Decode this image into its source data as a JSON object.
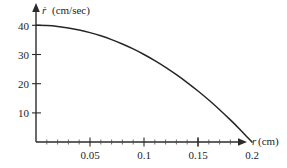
{
  "chart_data": {
    "type": "line",
    "title": "",
    "subtitle": "",
    "xlabel_var": "r",
    "xlabel_units": "(cm)",
    "xlabel": "r (cm)",
    "ylabel_var": "ṙ",
    "ylabel_units": "(cm/sec)",
    "ylabel": "ṙ (cm/sec)",
    "xlim": [
      0,
      0.215
    ],
    "ylim": [
      0,
      43
    ],
    "grid": false,
    "legend": null,
    "x_ticks": [
      0.05,
      0.1,
      0.15,
      0.2
    ],
    "x_tick_labels": [
      "0.05",
      "0.1",
      "0.15",
      "0.2"
    ],
    "x_minor_tick_count_between": 4,
    "y_ticks": [
      10,
      20,
      30,
      40
    ],
    "y_tick_labels": [
      "10",
      "20",
      "30",
      "40"
    ],
    "series": [
      {
        "name": "radial velocity",
        "x": [
          0.0,
          0.01,
          0.02,
          0.03,
          0.04,
          0.05,
          0.06,
          0.07,
          0.08,
          0.09,
          0.1,
          0.11,
          0.12,
          0.13,
          0.14,
          0.15,
          0.16,
          0.17,
          0.18,
          0.19,
          0.195,
          0.2
        ],
        "values": [
          40.0,
          39.9,
          39.6,
          39.1,
          38.4,
          37.5,
          36.4,
          35.1,
          33.6,
          31.9,
          30.0,
          27.9,
          25.6,
          23.1,
          20.4,
          17.5,
          14.4,
          11.1,
          7.6,
          3.9,
          1.95,
          0.0
        ]
      }
    ],
    "annotations": [],
    "axis_style": "arrow-terminated",
    "colors": {
      "curve": "#262626",
      "axis": "#2b2b2b",
      "text": "#1d1d1d",
      "background": "#ffffff"
    }
  }
}
